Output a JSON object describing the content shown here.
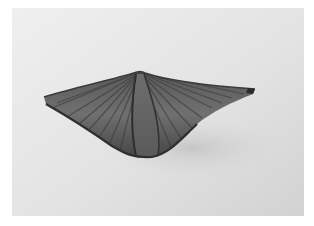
{
  "image": {
    "subject": "fossil brachiopod shell (spiriferid) photographed on plain background",
    "colors": {
      "border": "#ffffff",
      "background_light": "#ececec",
      "background_dark": "#cfcfcf",
      "shell_light": "#8a8a8a",
      "shell_mid": "#6a6a6a",
      "shell_dark": "#3c3c3c"
    }
  }
}
